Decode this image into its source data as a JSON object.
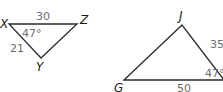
{
  "triangles": [
    {
      "name": "XYZ",
      "vertices": {
        "X": {
          "label": "X"
        },
        "Y": {
          "label": "Y"
        },
        "Z": {
          "label": "Z"
        }
      },
      "sides": {
        "XZ": "30",
        "XY": "21"
      },
      "angles": {
        "X": "47°"
      }
    },
    {
      "name": "GJ?",
      "vertices": {
        "J": {
          "label": "J"
        },
        "G": {
          "label": "G"
        }
      },
      "sides": {
        "J_right": "35",
        "G_right": "50"
      },
      "angles": {
        "right": "47°"
      }
    }
  ],
  "colors": {
    "edge": "#2b2b2b",
    "vertex_label": "#1a1a1a",
    "measure_label": "#6d6d6d"
  }
}
